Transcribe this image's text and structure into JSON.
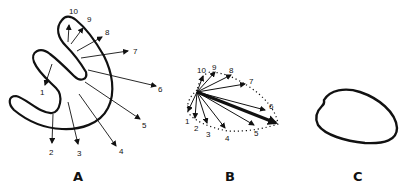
{
  "figure": {
    "panels": [
      {
        "label": "A",
        "description": "S-shaped outline with numbered vectors 1-10 radiating from interior points",
        "vector_labels": [
          "1",
          "2",
          "3",
          "4",
          "5",
          "6",
          "7",
          "8",
          "9",
          "10"
        ]
      },
      {
        "label": "B",
        "description": "Vectors 1-10 drawn from a common origin, tips joined by a dotted loop; one heavy resultant arrow",
        "vector_labels": [
          "1",
          "2",
          "3",
          "4",
          "5",
          "6",
          "7",
          "8",
          "9",
          "10"
        ]
      },
      {
        "label": "C",
        "description": "Closed loop outline"
      }
    ],
    "colors": {
      "ink": "#111111",
      "background": "#ffffff"
    }
  }
}
